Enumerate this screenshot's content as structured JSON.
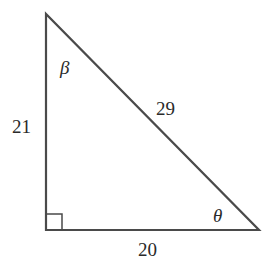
{
  "diagram": {
    "type": "right-triangle",
    "vertices": {
      "top": [
        46,
        14
      ],
      "right_angle": [
        46,
        230
      ],
      "bottom_right": [
        259,
        230
      ]
    },
    "sides": {
      "vertical": "21",
      "horizontal": "20",
      "hypotenuse": "29"
    },
    "angles": {
      "top": "β",
      "bottom_right": "θ"
    },
    "stroke_color": "#4a4a4a"
  }
}
